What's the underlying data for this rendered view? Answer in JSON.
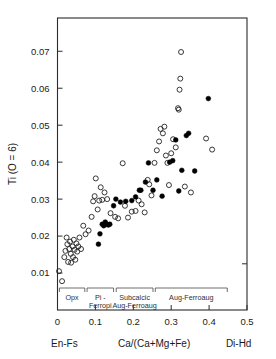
{
  "figure": {
    "background_color": "#ffffff",
    "ink_color": "#1a1a1a"
  },
  "chart_data": {
    "type": "scatter",
    "title": "",
    "xlabel": "Ca/(Ca+Mg+Fe)",
    "ylabel": "Ti (O = 6)",
    "xlim": [
      0.0,
      0.5
    ],
    "ylim": [
      0.0,
      0.079
    ],
    "grid": false,
    "legend_position": "none",
    "x_ticks": [
      0,
      0.1,
      0.2,
      0.3,
      0.4,
      0.5
    ],
    "x_tick_labels": [
      "0",
      "0.1",
      "0.2",
      "0.3",
      "0.4",
      "0.5"
    ],
    "y_ticks": [
      0.01,
      0.02,
      0.03,
      0.04,
      0.05,
      0.06,
      0.07
    ],
    "y_tick_labels": [
      "0.01",
      "0.02",
      "0.03",
      "0.04",
      "0.05",
      "0.06",
      "0.07"
    ],
    "axis_end_label_left": "En-Fs",
    "axis_end_label_right": "Di-Hd",
    "series": [
      {
        "name": "open-circles",
        "marker": "open circle",
        "color": "#222222",
        "points": [
          [
            0.004,
            0.0105
          ],
          [
            0.012,
            0.0078
          ],
          [
            0.018,
            0.0143
          ],
          [
            0.021,
            0.016
          ],
          [
            0.024,
            0.0196
          ],
          [
            0.026,
            0.0178
          ],
          [
            0.028,
            0.013
          ],
          [
            0.031,
            0.0165
          ],
          [
            0.033,
            0.0185
          ],
          [
            0.035,
            0.0152
          ],
          [
            0.036,
            0.0128
          ],
          [
            0.04,
            0.0172
          ],
          [
            0.041,
            0.0143
          ],
          [
            0.043,
            0.019
          ],
          [
            0.045,
            0.0163
          ],
          [
            0.047,
            0.0136
          ],
          [
            0.05,
            0.018
          ],
          [
            0.052,
            0.0158
          ],
          [
            0.055,
            0.0172
          ],
          [
            0.058,
            0.0196
          ],
          [
            0.062,
            0.0165
          ],
          [
            0.068,
            0.0228
          ],
          [
            0.074,
            0.0205
          ],
          [
            0.082,
            0.0215
          ],
          [
            0.09,
            0.0252
          ],
          [
            0.094,
            0.0294
          ],
          [
            0.098,
            0.0308
          ],
          [
            0.101,
            0.0356
          ],
          [
            0.106,
            0.0272
          ],
          [
            0.11,
            0.0296
          ],
          [
            0.114,
            0.0332
          ],
          [
            0.118,
            0.0298
          ],
          [
            0.124,
            0.0318
          ],
          [
            0.131,
            0.03
          ],
          [
            0.14,
            0.0262
          ],
          [
            0.152,
            0.0252
          ],
          [
            0.16,
            0.0248
          ],
          [
            0.172,
            0.0397
          ],
          [
            0.178,
            0.0282
          ],
          [
            0.186,
            0.025
          ],
          [
            0.196,
            0.0266
          ],
          [
            0.206,
            0.0268
          ],
          [
            0.214,
            0.0296
          ],
          [
            0.222,
            0.0286
          ],
          [
            0.23,
            0.0264
          ],
          [
            0.238,
            0.0352
          ],
          [
            0.242,
            0.034
          ],
          [
            0.248,
            0.031
          ],
          [
            0.256,
            0.0398
          ],
          [
            0.262,
            0.0432
          ],
          [
            0.268,
            0.0456
          ],
          [
            0.272,
            0.049
          ],
          [
            0.278,
            0.0478
          ],
          [
            0.282,
            0.0496
          ],
          [
            0.286,
            0.0418
          ],
          [
            0.29,
            0.0398
          ],
          [
            0.294,
            0.0338
          ],
          [
            0.3,
            0.0424
          ],
          [
            0.305,
            0.0462
          ],
          [
            0.312,
            0.044
          ],
          [
            0.318,
            0.0546
          ],
          [
            0.32,
            0.0542
          ],
          [
            0.322,
            0.0596
          ],
          [
            0.324,
            0.0626
          ],
          [
            0.326,
            0.0698
          ],
          [
            0.336,
            0.0334
          ],
          [
            0.352,
            0.0318
          ],
          [
            0.392,
            0.0464
          ],
          [
            0.408,
            0.0434
          ]
        ]
      },
      {
        "name": "filled-circles",
        "marker": "filled circle",
        "color": "#000000",
        "points": [
          [
            0.108,
            0.0178
          ],
          [
            0.112,
            0.0206
          ],
          [
            0.118,
            0.0232
          ],
          [
            0.122,
            0.0228
          ],
          [
            0.126,
            0.0238
          ],
          [
            0.13,
            0.0232
          ],
          [
            0.134,
            0.023
          ],
          [
            0.138,
            0.0232
          ],
          [
            0.148,
            0.0282
          ],
          [
            0.154,
            0.03
          ],
          [
            0.166,
            0.0292
          ],
          [
            0.18,
            0.0294
          ],
          [
            0.196,
            0.0296
          ],
          [
            0.206,
            0.0306
          ],
          [
            0.216,
            0.0324
          ],
          [
            0.22,
            0.0324
          ],
          [
            0.232,
            0.0346
          ],
          [
            0.24,
            0.0398
          ],
          [
            0.252,
            0.0324
          ],
          [
            0.262,
            0.0352
          ],
          [
            0.276,
            0.0308
          ],
          [
            0.296,
            0.04
          ],
          [
            0.304,
            0.0404
          ],
          [
            0.312,
            0.046
          ],
          [
            0.32,
            0.0322
          ],
          [
            0.328,
            0.0378
          ],
          [
            0.34,
            0.0472
          ],
          [
            0.346,
            0.0478
          ],
          [
            0.362,
            0.0376
          ],
          [
            0.398,
            0.0572
          ]
        ]
      }
    ],
    "field_brackets": [
      {
        "label_lines": [
          "Opx"
        ],
        "x_start": 0.005,
        "x_end": 0.072
      },
      {
        "label_lines": [
          "Pi -",
          "Ferropi"
        ],
        "x_start": 0.078,
        "x_end": 0.148
      },
      {
        "label_lines": [
          "Subcalcic",
          "Aug-Ferroaug"
        ],
        "x_start": 0.155,
        "x_end": 0.252
      },
      {
        "label_lines": [
          "Aug-Ferroaug"
        ],
        "x_start": 0.258,
        "x_end": 0.448
      }
    ]
  }
}
